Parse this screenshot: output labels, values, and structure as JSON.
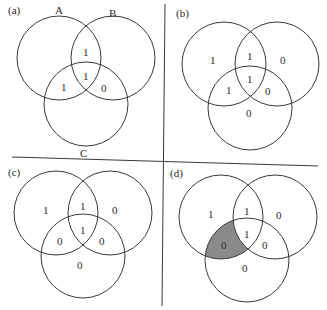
{
  "figure": {
    "set_labels": {
      "A": "A",
      "B": "B",
      "C": "C"
    },
    "shade_color": "#8a8a8a",
    "line_color": "#3a3a3a",
    "panels": [
      {
        "id": "a",
        "label": "(a)",
        "show_set_labels": true,
        "regions": {
          "A_only": "",
          "B_only": "",
          "C_only": "",
          "AB": "1",
          "AC": "1",
          "BC": "0",
          "ABC": "1"
        },
        "shaded": []
      },
      {
        "id": "b",
        "label": "(b)",
        "show_set_labels": false,
        "regions": {
          "A_only": "1",
          "B_only": "0",
          "C_only": "0",
          "AB": "1",
          "AC": "1",
          "BC": "0",
          "ABC": "1"
        },
        "shaded": []
      },
      {
        "id": "c",
        "label": "(c)",
        "show_set_labels": false,
        "regions": {
          "A_only": "1",
          "B_only": "0",
          "C_only": "0",
          "AB": "1",
          "AC": "0",
          "BC": "0",
          "ABC": "1"
        },
        "shaded": []
      },
      {
        "id": "d",
        "label": "(d)",
        "show_set_labels": false,
        "regions": {
          "A_only": "1",
          "B_only": "0",
          "C_only": "0",
          "AB": "1",
          "AC": "0",
          "BC": "0",
          "ABC": "1"
        },
        "shaded": [
          "AC"
        ]
      }
    ]
  }
}
